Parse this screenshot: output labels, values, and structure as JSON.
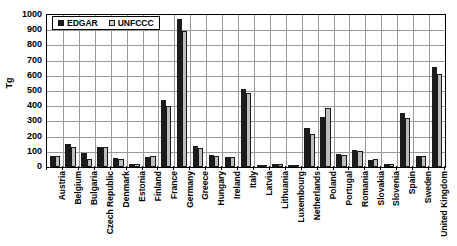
{
  "chart_data": {
    "type": "bar",
    "title": "",
    "subtitle": "",
    "xlabel": "",
    "ylabel": "Tg",
    "ylim": [
      0,
      1000
    ],
    "ytick_step": 100,
    "yticks": [
      0,
      100,
      200,
      300,
      400,
      500,
      600,
      700,
      800,
      900,
      1000
    ],
    "grid": true,
    "grid_axis": "both",
    "legend_position": "top-left-inside",
    "categories": [
      "Austria",
      "Belgium",
      "Bulgaria",
      "Czech Republic",
      "Denmark",
      "Estonia",
      "Finland",
      "France",
      "Germany",
      "Greece",
      "Hungary",
      "Ireland",
      "Italy",
      "Latvia",
      "Lithuania",
      "Luxembourg",
      "Netherlands",
      "Poland",
      "Portugal",
      "Romania",
      "Slovakia",
      "Slovenia",
      "Spain",
      "Sweden",
      "United Kingdom"
    ],
    "series": [
      {
        "name": "EDGAR",
        "color": "#1c1c1c",
        "values": [
          75,
          150,
          95,
          130,
          60,
          18,
          65,
          440,
          975,
          135,
          80,
          65,
          510,
          12,
          20,
          12,
          255,
          330,
          85,
          110,
          45,
          20,
          355,
          75,
          655
        ]
      },
      {
        "name": "UNFCCC",
        "color": "#bdbdbd",
        "values": [
          70,
          130,
          55,
          130,
          55,
          20,
          70,
          400,
          895,
          125,
          75,
          65,
          490,
          10,
          22,
          10,
          215,
          390,
          80,
          105,
          50,
          20,
          325,
          70,
          610
        ]
      }
    ]
  },
  "legend": {
    "entries": [
      {
        "label": "EDGAR",
        "swatch": "black-square-marker"
      },
      {
        "label": "UNFCCC",
        "swatch": "light-gray-square-marker"
      }
    ]
  },
  "axes": {
    "y_title": "Tg",
    "y_tick_labels": [
      "1000",
      "900",
      "800",
      "700",
      "600",
      "500",
      "400",
      "300",
      "200",
      "100",
      "0"
    ]
  },
  "colors": {
    "edgar": "#1c1c1c",
    "unfccc": "#bdbdbd",
    "grid": "#999999",
    "axis": "#000000",
    "background": "#ffffff"
  }
}
